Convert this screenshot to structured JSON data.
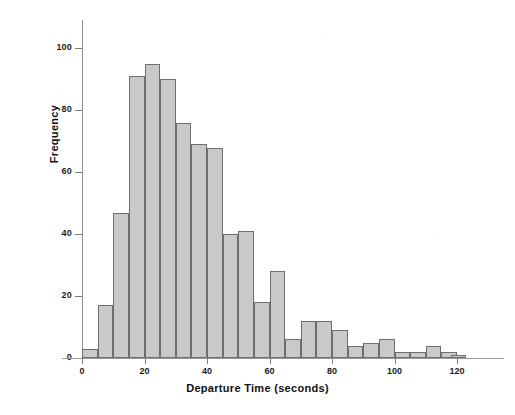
{
  "chart_data": {
    "type": "bar",
    "title": "",
    "subtitle": "",
    "xlabel": "Departure Time (seconds)",
    "ylabel": "Frequency",
    "xlim": [
      0,
      120
    ],
    "ylim": [
      0,
      105
    ],
    "bin_width": 5,
    "grid": false,
    "legend": null,
    "xticks": [
      0,
      20,
      40,
      60,
      80,
      100,
      120
    ],
    "xtick_labels": [
      "0",
      "20",
      "40",
      "60",
      "80",
      "100",
      "120"
    ],
    "yticks": [
      0,
      20,
      40,
      60,
      80,
      100
    ],
    "ytick_labels": [
      "0",
      "20",
      "40",
      "60",
      "80",
      "100"
    ],
    "bin_starts": [
      0,
      5,
      10,
      15,
      20,
      25,
      30,
      35,
      40,
      45,
      50,
      55,
      60,
      65,
      70,
      75,
      80,
      85,
      90,
      95,
      100,
      105,
      110,
      115
    ],
    "categories": [
      "0-5",
      "5-10",
      "10-15",
      "15-20",
      "20-25",
      "25-30",
      "30-35",
      "35-40",
      "40-45",
      "45-50",
      "50-55",
      "55-60",
      "60-65",
      "65-70",
      "70-75",
      "75-80",
      "80-85",
      "85-90",
      "90-95",
      "95-100",
      "100-105",
      "105-110",
      "110-115",
      "115-120"
    ],
    "values": [
      3,
      17,
      47,
      91,
      95,
      90,
      76,
      69,
      68,
      40,
      41,
      18,
      28,
      6,
      12,
      12,
      9,
      4,
      5,
      6,
      2,
      2,
      4,
      2
    ],
    "tail_values": [
      1
    ],
    "tail_bin": "118-121",
    "colors": {
      "bar_fill": "#c9c9c9",
      "bar_edge": "#6e6e6e",
      "axis": "#8f8f8f",
      "text": "#1c1c1c",
      "background": "#ffffff"
    }
  },
  "axes": {
    "x_title": "Departure Time (seconds)",
    "y_title": "Frequency"
  }
}
